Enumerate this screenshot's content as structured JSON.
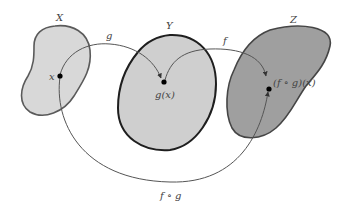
{
  "diagram": {
    "sets": [
      {
        "id": "X",
        "label": "X",
        "fill": "#d6d6d6",
        "stroke": "#555555"
      },
      {
        "id": "Y",
        "label": "Y",
        "fill": "#cfcfcf",
        "stroke": "#222222"
      },
      {
        "id": "Z",
        "label": "Z",
        "fill": "#9e9e9e",
        "stroke": "#444444"
      }
    ],
    "points": [
      {
        "id": "x",
        "label": "x"
      },
      {
        "id": "gx",
        "label": "g(x)"
      },
      {
        "id": "fgx",
        "label": "(f ∘ g)(x)"
      }
    ],
    "arrows": [
      {
        "id": "g",
        "label": "g",
        "from": "x",
        "to": "gx"
      },
      {
        "id": "f",
        "label": "f",
        "from": "gx",
        "to": "fgx"
      },
      {
        "id": "fog",
        "label": "f ∘ g",
        "from": "x",
        "to": "fgx"
      }
    ],
    "colors": {
      "arrow": "#555555",
      "point": "#000000",
      "text": "#444444"
    }
  }
}
